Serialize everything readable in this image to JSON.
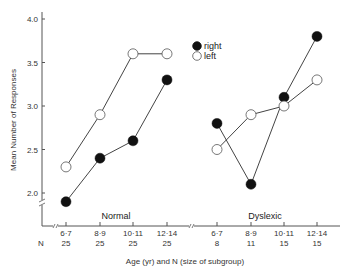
{
  "chart_data": {
    "type": "line",
    "title": "",
    "ylabel": "Mean Number of Responses",
    "xlabel": "Age (yr) and N (size of subgroup)",
    "ylim": [
      1.8,
      4.1
    ],
    "yticks": [
      2.0,
      2.5,
      3.0,
      3.5,
      4.0
    ],
    "ytick_labels": [
      "2.0",
      "2.5",
      "3.0",
      "3.5",
      "4.0"
    ],
    "grid": false,
    "legend_position": "upper center",
    "legend": [
      {
        "name": "right",
        "marker": "filled-circle"
      },
      {
        "name": "left",
        "marker": "open-circle"
      }
    ],
    "panels": [
      {
        "name": "Normal",
        "categories": [
          "6·7",
          "8·9",
          "10·11",
          "12·14"
        ],
        "n": [
          "25",
          "25",
          "25",
          "25"
        ],
        "series": [
          {
            "name": "right",
            "values": [
              1.9,
              2.4,
              2.6,
              3.3
            ]
          },
          {
            "name": "left",
            "values": [
              2.3,
              2.9,
              3.6,
              3.6
            ]
          }
        ]
      },
      {
        "name": "Dyslexic",
        "categories": [
          "6·7",
          "8·9",
          "10·11",
          "12·14"
        ],
        "n": [
          "8",
          "11",
          "15",
          "15"
        ],
        "series": [
          {
            "name": "right",
            "values": [
              2.8,
              2.1,
              3.1,
              3.8
            ]
          },
          {
            "name": "left",
            "values": [
              2.5,
              2.9,
              3.0,
              3.3
            ]
          }
        ]
      }
    ],
    "n_label": "N"
  },
  "colors": {
    "line": "#444444",
    "filled_marker": "#111111",
    "open_marker_fill": "#ffffff",
    "axis": "#555555"
  }
}
